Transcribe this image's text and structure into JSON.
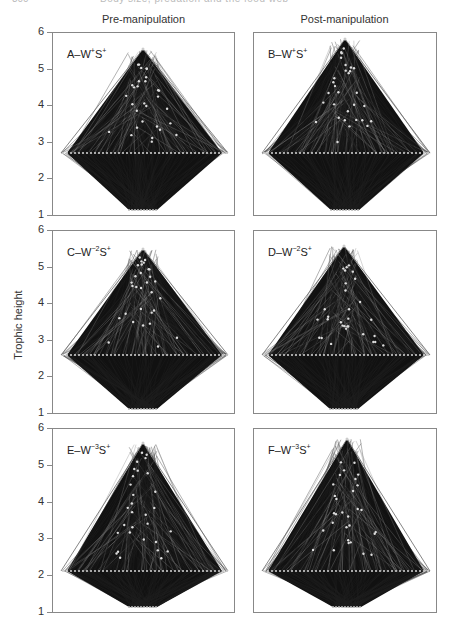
{
  "running_head": {
    "page": "300",
    "title": "Body size, predation and the food web"
  },
  "columns": [
    "Pre-manipulation",
    "Post-manipulation"
  ],
  "y_axis_label": "Trophic height",
  "y_ticks": [
    "6",
    "5",
    "4",
    "3",
    "2",
    "1"
  ],
  "panels": [
    {
      "id": "A",
      "label": "A–W",
      "sup1": "+",
      "mid": "S",
      "sup2": "+"
    },
    {
      "id": "B",
      "label": "B–W",
      "sup1": "+",
      "mid": "S",
      "sup2": "+"
    },
    {
      "id": "C",
      "label": "C–W",
      "sup1": "−2",
      "mid": "S",
      "sup2": "+"
    },
    {
      "id": "D",
      "label": "D–W",
      "sup1": "−2",
      "mid": "S",
      "sup2": "+"
    },
    {
      "id": "E",
      "label": "E–W",
      "sup1": "−3",
      "mid": "S",
      "sup2": "+"
    },
    {
      "id": "F",
      "label": "F–W",
      "sup1": "−3",
      "mid": "S",
      "sup2": "+"
    }
  ],
  "chart_data": [
    {
      "type": "scatter",
      "panel": "A",
      "title": "A–W+S+",
      "column": "Pre-manipulation",
      "ylabel": "Trophic height",
      "ylim": [
        1,
        6
      ],
      "yticks": [
        1,
        2,
        3,
        4,
        5,
        6
      ],
      "max_trophic_height": 5.6,
      "basal_level": 1.25,
      "primary_consumer_level": 2.2,
      "note": "food web network diagram; nodes connected by feeding links"
    },
    {
      "type": "scatter",
      "panel": "B",
      "title": "B–W+S+",
      "column": "Post-manipulation",
      "ylabel": "Trophic height",
      "ylim": [
        1,
        6
      ],
      "yticks": [
        1,
        2,
        3,
        4,
        5,
        6
      ],
      "max_trophic_height": 5.9,
      "basal_level": 1.25,
      "primary_consumer_level": 2.2,
      "note": "food web network diagram"
    },
    {
      "type": "scatter",
      "panel": "C",
      "title": "C–W-2S+",
      "column": "Pre-manipulation",
      "ylabel": "Trophic height",
      "ylim": [
        1,
        6
      ],
      "yticks": [
        1,
        2,
        3,
        4,
        5,
        6
      ],
      "max_trophic_height": 5.5,
      "basal_level": 1.2,
      "primary_consumer_level": 2.1,
      "note": "food web network diagram"
    },
    {
      "type": "scatter",
      "panel": "D",
      "title": "D–W-2S+",
      "column": "Post-manipulation",
      "ylabel": "Trophic height",
      "ylim": [
        1,
        6
      ],
      "yticks": [
        1,
        2,
        3,
        4,
        5,
        6
      ],
      "max_trophic_height": 5.5,
      "basal_level": 1.2,
      "primary_consumer_level": 2.1,
      "note": "food web network diagram"
    },
    {
      "type": "scatter",
      "panel": "E",
      "title": "E–W-3S+",
      "column": "Pre-manipulation",
      "ylabel": "Trophic height",
      "ylim": [
        1,
        6
      ],
      "yticks": [
        1,
        2,
        3,
        4,
        5,
        6
      ],
      "max_trophic_height": 5.6,
      "basal_level": 1.25,
      "primary_consumer_level": 2.2,
      "note": "food web network diagram"
    },
    {
      "type": "scatter",
      "panel": "F",
      "title": "F–W-3S+",
      "column": "Post-manipulation",
      "ylabel": "Trophic height",
      "ylim": [
        1,
        6
      ],
      "yticks": [
        1,
        2,
        3,
        4,
        5,
        6
      ],
      "max_trophic_height": 5.7,
      "basal_level": 1.25,
      "primary_consumer_level": 2.2,
      "note": "food web network diagram"
    }
  ]
}
